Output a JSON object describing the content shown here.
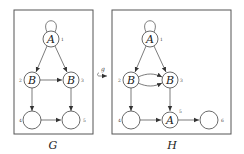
{
  "diagram": {
    "graphs": [
      {
        "caption": "G",
        "box": {
          "x": 14,
          "y": 10,
          "w": 79,
          "h": 124
        },
        "nodes": [
          {
            "id": "1",
            "label": "A",
            "x": 51,
            "y": 39,
            "index_pos": "right"
          },
          {
            "id": "2",
            "label": "B",
            "x": 32,
            "y": 80,
            "index_pos": "left"
          },
          {
            "id": "3",
            "label": "B",
            "x": 71,
            "y": 80,
            "index_pos": "right"
          },
          {
            "id": "4",
            "label": "",
            "x": 32,
            "y": 120,
            "index_pos": "left"
          },
          {
            "id": "5",
            "label": "",
            "x": 71,
            "y": 120,
            "index_pos": "right"
          }
        ],
        "edges": [
          {
            "from": "1",
            "to": "1",
            "type": "loop"
          },
          {
            "from": "1",
            "to": "2"
          },
          {
            "from": "1",
            "to": "3"
          },
          {
            "from": "2",
            "to": "3"
          },
          {
            "from": "2",
            "to": "4"
          },
          {
            "from": "3",
            "to": "5"
          },
          {
            "from": "4",
            "to": "5"
          }
        ]
      },
      {
        "caption": "H",
        "box": {
          "x": 112,
          "y": 10,
          "w": 119,
          "h": 124
        },
        "nodes": [
          {
            "id": "1",
            "label": "A",
            "x": 150,
            "y": 39,
            "index_pos": "right"
          },
          {
            "id": "2",
            "label": "B",
            "x": 131,
            "y": 80,
            "index_pos": "left"
          },
          {
            "id": "3",
            "label": "B",
            "x": 170,
            "y": 80,
            "index_pos": "right"
          },
          {
            "id": "4",
            "label": "",
            "x": 131,
            "y": 120,
            "index_pos": "left"
          },
          {
            "id": "5",
            "label": "A",
            "x": 170,
            "y": 120,
            "index_pos": "top-right"
          },
          {
            "id": "6",
            "label": "",
            "x": 209,
            "y": 120,
            "index_pos": "right"
          }
        ],
        "edges": [
          {
            "from": "1",
            "to": "1",
            "type": "loop"
          },
          {
            "from": "1",
            "to": "2"
          },
          {
            "from": "1",
            "to": "3"
          },
          {
            "from": "2",
            "to": "3",
            "type": "curved-up"
          },
          {
            "from": "2",
            "to": "3",
            "type": "curved-down"
          },
          {
            "from": "2",
            "to": "4"
          },
          {
            "from": "3",
            "to": "5"
          },
          {
            "from": "4",
            "to": "5"
          },
          {
            "from": "5",
            "to": "6"
          }
        ]
      }
    ],
    "morphism": {
      "label": "g",
      "symbol": "hooked-arrow",
      "x": 103,
      "y": 74
    }
  },
  "labels": {
    "G": {
      "caption": "G",
      "n1": "A",
      "n2": "B",
      "n3": "B",
      "i1": "1",
      "i2": "2",
      "i3": "3",
      "i4": "4",
      "i5": "5"
    },
    "H": {
      "caption": "H",
      "n1": "A",
      "n2": "B",
      "n3": "B",
      "n5": "A",
      "i1": "1",
      "i2": "2",
      "i3": "3",
      "i4": "4",
      "i5": "5",
      "i6": "6"
    },
    "morphism": "g"
  }
}
